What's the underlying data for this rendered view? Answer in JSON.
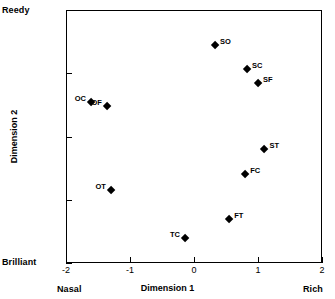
{
  "chart_data": {
    "type": "scatter",
    "title": "",
    "xlabel": "Dimension 1",
    "ylabel": "Dimension 2",
    "xlim": [
      -2,
      2
    ],
    "ylim": [
      -2,
      2
    ],
    "xticks": [
      "-2",
      "-1",
      "0",
      "1",
      "2"
    ],
    "yticks": [
      "2",
      "1",
      "0",
      "-1",
      "-2"
    ],
    "grid": false,
    "legend": "none",
    "anchors": {
      "top_left": "Reedy",
      "bottom_left": "Brilliant",
      "x_axis_left": "Nasal",
      "x_axis_right": "Rich"
    },
    "points": [
      {
        "label": "SO",
        "x": 0.33,
        "y": 1.45,
        "label_side": "right"
      },
      {
        "label": "SC",
        "x": 0.83,
        "y": 1.07,
        "label_side": "right"
      },
      {
        "label": "SF",
        "x": 1.0,
        "y": 0.84,
        "label_side": "right"
      },
      {
        "label": "OC",
        "x": -1.61,
        "y": 0.55,
        "label_side": "left"
      },
      {
        "label": "OF",
        "x": -1.36,
        "y": 0.48,
        "label_side": "left"
      },
      {
        "label": "ST",
        "x": 1.1,
        "y": -0.2,
        "label_side": "right"
      },
      {
        "label": "FC",
        "x": 0.8,
        "y": -0.6,
        "label_side": "right"
      },
      {
        "label": "OT",
        "x": -1.3,
        "y": -0.85,
        "label_side": "left"
      },
      {
        "label": "FT",
        "x": 0.55,
        "y": -1.3,
        "label_side": "right"
      },
      {
        "label": "TC",
        "x": -0.14,
        "y": -1.6,
        "label_side": "left"
      }
    ]
  }
}
